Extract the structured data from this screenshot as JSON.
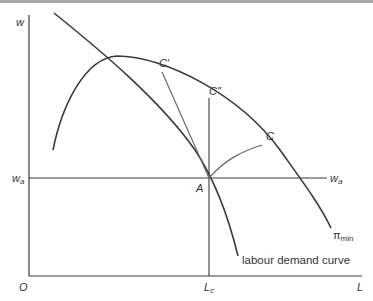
{
  "diagram": {
    "type": "economics-labour-market",
    "axes": {
      "y_label": "w",
      "x_label": "L",
      "origin_label": "O"
    },
    "wage_line": {
      "label_left": "w",
      "label_left_sub": "a",
      "label_right": "w",
      "label_right_sub": "a"
    },
    "employment_marker": {
      "label": "L",
      "label_sub": "c"
    },
    "points": {
      "A": "A",
      "C": "C",
      "C_prime": "C′",
      "C_double_prime": "C″"
    },
    "curves": {
      "labour_demand": "labour demand curve",
      "profit_constraint": "π",
      "profit_constraint_sub": "min"
    },
    "colors": {
      "line": "#3a3a3a",
      "chord": "#6a6a6a",
      "top_strip": "#a9a9a9"
    }
  }
}
